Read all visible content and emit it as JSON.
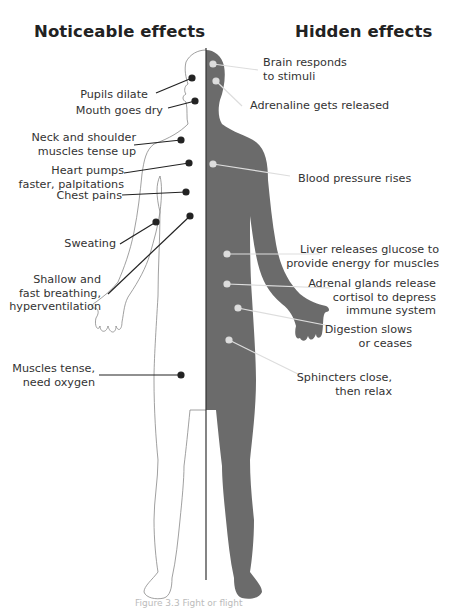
{
  "headings": {
    "left": "Noticeable effects",
    "right": "Hidden effects"
  },
  "noticeable_effects": [
    {
      "lines": [
        "Pupils dilate"
      ]
    },
    {
      "lines": [
        "Mouth goes dry"
      ]
    },
    {
      "lines": [
        "Neck and shoulder",
        "muscles tense up"
      ]
    },
    {
      "lines": [
        "Heart pumps",
        "faster, palpitations"
      ]
    },
    {
      "lines": [
        "Chest pains"
      ]
    },
    {
      "lines": [
        "Sweating"
      ]
    },
    {
      "lines": [
        "Shallow and",
        "fast breathing,",
        "hyperventilation"
      ]
    },
    {
      "lines": [
        "Muscles tense,",
        "need oxygen"
      ]
    }
  ],
  "hidden_effects": [
    {
      "lines": [
        "Brain responds",
        "to stimuli"
      ]
    },
    {
      "lines": [
        "Adrenaline gets released"
      ]
    },
    {
      "lines": [
        "Blood pressure rises"
      ]
    },
    {
      "lines": [
        "Liver releases glucose to",
        "provide energy for muscles"
      ]
    },
    {
      "lines": [
        "Adrenal glands release",
        "cortisol to depress",
        "immune system"
      ]
    },
    {
      "lines": [
        "Digestion slows",
        "or ceases"
      ]
    },
    {
      "lines": [
        "Sphincters close,",
        "then relax"
      ]
    }
  ],
  "colors": {
    "silhouette": "#6b6b6b",
    "outline": "#888888",
    "divider": "#333333",
    "left_pointer": "#222222",
    "right_pointer": "#dddddd"
  },
  "caption": {
    "text": "Figure 3.3 Fight or flight",
    "partially_visible": true
  }
}
